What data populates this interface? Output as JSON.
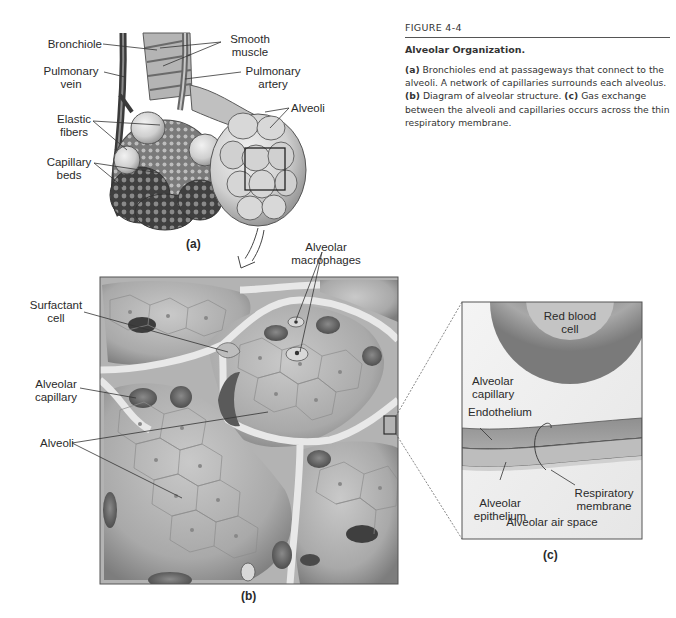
{
  "caption": {
    "figure_number": "FIGURE 4-4",
    "title": "Alveolar Organization.",
    "parts": [
      {
        "tag": "(a)",
        "text": " Bronchioles end at passageways that connect to the alveoli. A network of capillaries surrounds each alveolus. "
      },
      {
        "tag": "(b)",
        "text": " Diagram of alveolar structure. "
      },
      {
        "tag": "(c)",
        "text": " Gas exchange between the alveoli and capillaries occurs across the thin respiratory membrane."
      }
    ]
  },
  "panel_a": {
    "letter": "(a)",
    "labels": {
      "bronchiole": "Bronchiole",
      "pulmonary_vein_1": "Pulmonary",
      "pulmonary_vein_2": "vein",
      "elastic_fibers_1": "Elastic",
      "elastic_fibers_2": "fibers",
      "capillary_beds_1": "Capillary",
      "capillary_beds_2": "beds",
      "smooth_muscle_1": "Smooth",
      "smooth_muscle_2": "muscle",
      "pulmonary_artery_1": "Pulmonary",
      "pulmonary_artery_2": "artery",
      "alveoli": "Alveoli"
    }
  },
  "panel_b": {
    "letter": "(b)",
    "labels": {
      "alveolar_macrophages_1": "Alveolar",
      "alveolar_macrophages_2": "macrophages",
      "surfactant_cell_1": "Surfactant",
      "surfactant_cell_2": "cell",
      "alveolar_capillary_1": "Alveolar",
      "alveolar_capillary_2": "capillary",
      "alveoli": "Alveoli"
    }
  },
  "panel_c": {
    "letter": "(c)",
    "labels": {
      "red_blood_cell_1": "Red blood",
      "red_blood_cell_2": "cell",
      "alveolar_capillary_1": "Alveolar",
      "alveolar_capillary_2": "capillary",
      "endothelium": "Endothelium",
      "respiratory_membrane_1": "Respiratory",
      "respiratory_membrane_2": "membrane",
      "alveolar_epithelium_1": "Alveolar",
      "alveolar_epithelium_2": "epithelium",
      "alveolar_air_space": "Alveolar air space"
    }
  }
}
